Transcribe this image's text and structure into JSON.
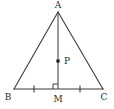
{
  "figure": {
    "background_color": "#ffffff",
    "line_color": "#3a3a3a",
    "label_color": "#2b2b2b",
    "width": 114,
    "height": 109,
    "points": {
      "A": {
        "label": "A",
        "x": 58,
        "y": 12,
        "label_x": 58,
        "label_y": 5
      },
      "B": {
        "label": "B",
        "x": 14,
        "y": 89,
        "label_x": 8,
        "label_y": 97
      },
      "C": {
        "label": "C",
        "x": 103,
        "y": 89,
        "label_x": 104,
        "label_y": 97
      },
      "M": {
        "label": "M",
        "x": 58,
        "y": 89,
        "label_x": 58,
        "label_y": 99
      },
      "P": {
        "label": "P",
        "x": 58,
        "y": 61,
        "label_x": 64,
        "label_y": 61
      }
    },
    "segments": [
      {
        "name": "side-AB",
        "from": "A",
        "to": "B"
      },
      {
        "name": "side-AC",
        "from": "A",
        "to": "C"
      },
      {
        "name": "base-BC",
        "from": "B",
        "to": "C"
      }
    ],
    "altitude": {
      "name": "altitude-AM",
      "from": "A",
      "to": "M"
    },
    "marks": {
      "right_angle": {
        "name": "right-angle-at-M",
        "at": "M",
        "size": 5
      },
      "congruent_ticks": [
        {
          "name": "tick-BM",
          "x": 34,
          "y": 89
        },
        {
          "name": "tick-MC",
          "x": 80,
          "y": 89
        }
      ]
    },
    "marked_point": {
      "name": "point-P",
      "radius": 1.9
    }
  }
}
